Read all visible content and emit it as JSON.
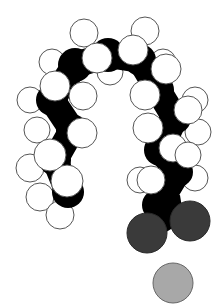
{
  "diagram": {
    "type": "space-filling molecular model",
    "colors": {
      "background": "#ffffff",
      "carbon": "#000000",
      "hydrogen_fill": "#ffffff",
      "hydrogen_stroke": "#555555",
      "oxygen": "#3a3a3a",
      "counter_ion": "#a8a8a8"
    },
    "carbons": [
      {
        "x": 68,
        "y": 192,
        "r": 16
      },
      {
        "x": 55,
        "y": 160,
        "r": 16
      },
      {
        "x": 72,
        "y": 130,
        "r": 16
      },
      {
        "x": 52,
        "y": 100,
        "r": 16
      },
      {
        "x": 75,
        "y": 65,
        "r": 17
      },
      {
        "x": 108,
        "y": 55,
        "r": 17
      },
      {
        "x": 140,
        "y": 60,
        "r": 16
      },
      {
        "x": 158,
        "y": 90,
        "r": 16
      },
      {
        "x": 175,
        "y": 118,
        "r": 16
      },
      {
        "x": 160,
        "y": 150,
        "r": 16
      },
      {
        "x": 178,
        "y": 172,
        "r": 15
      },
      {
        "x": 158,
        "y": 205,
        "r": 16
      }
    ],
    "hydrogens_back": [
      {
        "x": 40,
        "y": 197,
        "r": 14
      },
      {
        "x": 60,
        "y": 215,
        "r": 14
      },
      {
        "x": 30,
        "y": 168,
        "r": 14
      },
      {
        "x": 37,
        "y": 130,
        "r": 13
      },
      {
        "x": 30,
        "y": 100,
        "r": 13
      },
      {
        "x": 52,
        "y": 62,
        "r": 13
      },
      {
        "x": 84,
        "y": 33,
        "r": 14
      },
      {
        "x": 110,
        "y": 72,
        "r": 13
      },
      {
        "x": 145,
        "y": 31,
        "r": 14
      },
      {
        "x": 163,
        "y": 62,
        "r": 13
      },
      {
        "x": 195,
        "y": 100,
        "r": 13
      },
      {
        "x": 198,
        "y": 132,
        "r": 13
      },
      {
        "x": 140,
        "y": 180,
        "r": 13
      },
      {
        "x": 195,
        "y": 178,
        "r": 13
      }
    ],
    "hydrogens_front": [
      {
        "x": 67,
        "y": 181,
        "r": 16
      },
      {
        "x": 50,
        "y": 155,
        "r": 16
      },
      {
        "x": 82,
        "y": 133,
        "r": 15
      },
      {
        "x": 55,
        "y": 86,
        "r": 15
      },
      {
        "x": 83,
        "y": 96,
        "r": 14
      },
      {
        "x": 97,
        "y": 58,
        "r": 15
      },
      {
        "x": 133,
        "y": 50,
        "r": 15
      },
      {
        "x": 166,
        "y": 69,
        "r": 15
      },
      {
        "x": 145,
        "y": 95,
        "r": 15
      },
      {
        "x": 188,
        "y": 110,
        "r": 14
      },
      {
        "x": 173,
        "y": 148,
        "r": 14
      },
      {
        "x": 148,
        "y": 128,
        "r": 15
      },
      {
        "x": 151,
        "y": 180,
        "r": 14
      },
      {
        "x": 188,
        "y": 155,
        "r": 13
      }
    ],
    "oxygens": [
      {
        "x": 147,
        "y": 233,
        "r": 20
      },
      {
        "x": 190,
        "y": 221,
        "r": 20
      }
    ],
    "counter_ion": {
      "x": 173,
      "y": 283,
      "r": 20
    }
  }
}
